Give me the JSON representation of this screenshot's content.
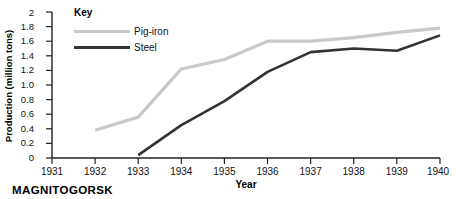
{
  "caption": "MAGNITOGORSK",
  "legend": {
    "title": "Key",
    "items": [
      {
        "label": "Pig-iron",
        "color": "#c9c9c9"
      },
      {
        "label": "Steel",
        "color": "#333333"
      }
    ]
  },
  "chart_data": {
    "type": "line",
    "title": "",
    "xlabel": "Year",
    "ylabel": "Production (million tons)",
    "categories": [
      "1931",
      "1932",
      "1933",
      "1934",
      "1935",
      "1936",
      "1937",
      "1938",
      "1939",
      "1940"
    ],
    "x": [
      1931,
      1932,
      1933,
      1934,
      1935,
      1936,
      1937,
      1938,
      1939,
      1940
    ],
    "xlim": [
      1931,
      1940
    ],
    "ylim": [
      0,
      2
    ],
    "yticks": [
      "0",
      "0.2",
      "0.4",
      "0.6",
      "0.8",
      "1.0",
      "1.2",
      "1.4",
      "1.6",
      "1.8",
      "2"
    ],
    "ytick_values": [
      0,
      0.2,
      0.4,
      0.6,
      0.8,
      1.0,
      1.2,
      1.4,
      1.6,
      1.8,
      2.0
    ],
    "grid": false,
    "legend_position": "top-left-inside",
    "series": [
      {
        "name": "Pig-iron",
        "color": "#c9c9c9",
        "x": [
          1932,
          1933,
          1934,
          1935,
          1936,
          1937,
          1938,
          1939,
          1940
        ],
        "values": [
          0.38,
          0.56,
          1.22,
          1.35,
          1.6,
          1.6,
          1.65,
          1.72,
          1.78
        ]
      },
      {
        "name": "Steel",
        "color": "#333333",
        "x": [
          1933,
          1934,
          1935,
          1936,
          1937,
          1938,
          1939,
          1940
        ],
        "values": [
          0.04,
          0.45,
          0.78,
          1.18,
          1.45,
          1.5,
          1.47,
          1.68
        ]
      }
    ]
  }
}
